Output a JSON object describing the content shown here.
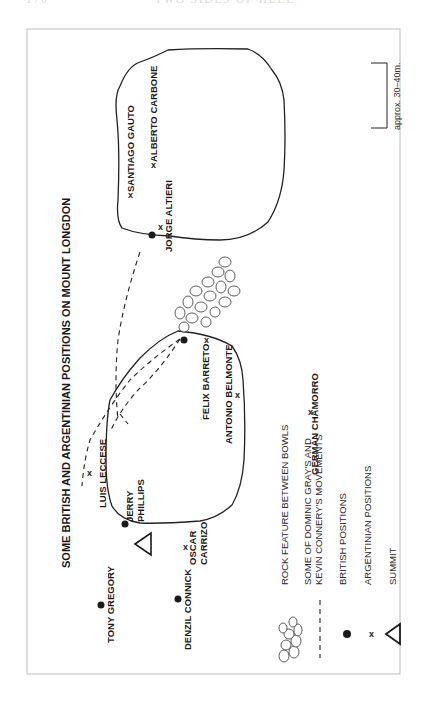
{
  "page_header": {
    "page_number": "170",
    "running_title": "TWO SIDES OF HELL"
  },
  "map": {
    "title": "SOME BRITISH AND ARGENTINIAN POSITIONS ON MOUNT LONGDON",
    "scale_label": "approx. 30–40m.",
    "british_positions": [
      {
        "name": "TONY GREGORY"
      },
      {
        "name": "DENZIL CONNICK"
      },
      {
        "name_line1": "JERRY",
        "name_line2": "PHILLIPS"
      },
      {
        "name": "(unlabelled, near Felix Barreto)"
      },
      {
        "name": "(unlabelled, near Jorge Altieri)"
      }
    ],
    "argentinian_positions": [
      {
        "name_line1": "OSCAR",
        "name_line2": "CARRIZO"
      },
      {
        "name": "LUIS LECCESE"
      },
      {
        "name": "FELIX BARRETO"
      },
      {
        "name": "ANTONIO BELMONTE"
      },
      {
        "name": "GERMÁN CHAMORRO"
      },
      {
        "name": "JORGE ALTIERI"
      },
      {
        "name": "SANTIAGO GAUTO"
      },
      {
        "name": "ALBERTO CARBONE"
      }
    ],
    "markers": {
      "argentinian": "x",
      "british": "●",
      "summit": "△"
    }
  },
  "legend": {
    "items": [
      {
        "symbol": "rock-cluster",
        "label": "ROCK FEATURE BETWEEN BOWLS"
      },
      {
        "symbol": "dashed-line",
        "label_line1": "SOME OF DOMINIC GRAY'S AND",
        "label_line2": "KEVIN CONNERY'S MOVEMENTS"
      },
      {
        "symbol": "filled-dot",
        "label": "BRITISH POSITIONS"
      },
      {
        "symbol": "x-mark",
        "label": "ARGENTINIAN POSITIONS"
      },
      {
        "symbol": "triangle",
        "label": "SUMMIT"
      }
    ]
  }
}
